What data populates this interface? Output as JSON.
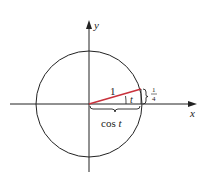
{
  "diagram": {
    "type": "unit-circle",
    "axes": {
      "x_label": "x",
      "y_label": "y"
    },
    "radius_label": "1",
    "angle_label": "t",
    "height_label": {
      "numerator": "1",
      "denominator": "4"
    },
    "base_label": "cos t",
    "colors": {
      "radius_segment": "#c8323c",
      "lines": "#222222"
    }
  }
}
